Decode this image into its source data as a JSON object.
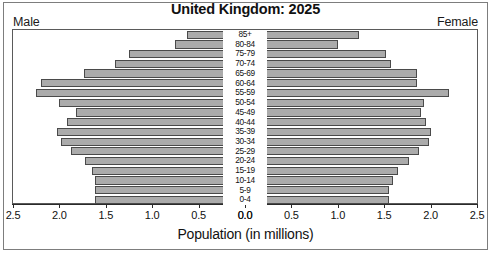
{
  "chart_data": {
    "type": "bar",
    "subtype": "population-pyramid",
    "title": "United Kingdom: 2025",
    "xlabel": "Population (in millions)",
    "ylabel": "",
    "grid": false,
    "legend_position": "corners",
    "left_side_label": "Male",
    "right_side_label": "Female",
    "xlim": [
      0,
      2.5
    ],
    "xticks": [
      2.5,
      2.0,
      1.5,
      1.0,
      0.5,
      0.0
    ],
    "xtick_labels_left": [
      "2.5",
      "2.0",
      "1.5",
      "1.0",
      "0.5",
      "0.0"
    ],
    "xtick_labels_right": [
      "0.0",
      "0.5",
      "1.0",
      "1.5",
      "2.0",
      "2.5"
    ],
    "categories": [
      "85+",
      "80-84",
      "75-79",
      "70-74",
      "65-69",
      "60-64",
      "55-59",
      "50-54",
      "45-49",
      "40-44",
      "35-39",
      "30-34",
      "25-29",
      "20-24",
      "15-19",
      "10-14",
      "5-9",
      "0-4"
    ],
    "series": [
      {
        "name": "Male",
        "side": "left",
        "values": [
          0.62,
          0.75,
          1.25,
          1.4,
          1.73,
          2.2,
          2.25,
          2.0,
          1.82,
          1.92,
          2.03,
          1.98,
          1.87,
          1.72,
          1.65,
          1.62,
          1.62,
          1.62
        ]
      },
      {
        "name": "Female",
        "side": "right",
        "values": [
          1.23,
          1.0,
          1.52,
          1.57,
          1.85,
          1.85,
          2.2,
          1.93,
          1.9,
          1.95,
          2.0,
          1.98,
          1.88,
          1.77,
          1.65,
          1.59,
          1.55,
          1.55
        ]
      }
    ],
    "colors": {
      "bar_fill": "#ababab",
      "bar_border": "#4a4a4a",
      "plot_background": "#ffffff",
      "text": "#111111",
      "frame": "#5a5a5a"
    }
  }
}
